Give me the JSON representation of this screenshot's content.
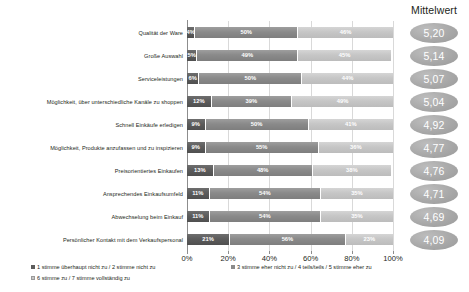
{
  "header": {
    "mean_column_title": "Mittelwert"
  },
  "chart_data": {
    "type": "bar",
    "subtype": "stacked-horizontal-100",
    "title": "",
    "xlabel": "",
    "ylabel": "",
    "xlim": [
      0,
      100
    ],
    "grid": true,
    "legend_position": "bottom-left",
    "categories": [
      "Qualität der Ware",
      "Große Auswahl",
      "Serviceleistungen",
      "Möglichkeit, über unterschiedliche Kanäle zu shoppen",
      "Schnell Einkäufe erledigen",
      "Möglichkeit, Produkte anzufassen und zu inspizieren",
      "Preisorientiertes Einkaufen",
      "Ansprechendes Einkaufsumfeld",
      "Abwechselung beim Einkauf",
      "Persönlicher Kontakt mit dem Verkaufspersonal"
    ],
    "series": [
      {
        "name": "1 stimme überhaupt nicht zu / 2 stimme nicht zu",
        "color": "#5c5c5c",
        "values": [
          4,
          5,
          6,
          12,
          9,
          9,
          13,
          11,
          11,
          21
        ],
        "labels": [
          "4%",
          "5%",
          "6%",
          "12%",
          "9%",
          "9%",
          "13%",
          "11%",
          "11%",
          "21%"
        ]
      },
      {
        "name": "3 stimme eher nicht zu / 4 teils/teils / 5 stimme eher zu",
        "color": "#8a8a8a",
        "values": [
          50,
          49,
          50,
          39,
          50,
          55,
          48,
          54,
          54,
          56
        ],
        "labels": [
          "50%",
          "49%",
          "50%",
          "39%",
          "50%",
          "55%",
          "48%",
          "54%",
          "54%",
          "56%"
        ]
      },
      {
        "name": "6 stimme zu / 7 stimme vollständig zu",
        "color": "#c6c6c6",
        "values": [
          46,
          45,
          44,
          49,
          41,
          36,
          38,
          35,
          35,
          23
        ],
        "labels": [
          "46%",
          "45%",
          "44%",
          "49%",
          "41%",
          "36%",
          "38%",
          "35%",
          "35%",
          "23%"
        ]
      }
    ],
    "means": [
      "5,20",
      "5,14",
      "5,07",
      "5,04",
      "4,92",
      "4,77",
      "4,76",
      "4,71",
      "4,69",
      "4,09"
    ],
    "xticks": [
      0,
      20,
      40,
      60,
      80,
      100
    ],
    "xticklabels": [
      "0%",
      "20%",
      "40%",
      "60%",
      "80%",
      "100%"
    ]
  }
}
